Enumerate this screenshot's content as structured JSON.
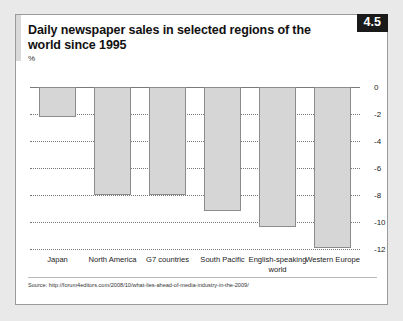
{
  "figure": {
    "number_badge": "4.5",
    "title": "Daily newspaper sales in selected regions of the world since 1995",
    "unit_label": "%",
    "source": "Source: http://forum4editors.com/2008/10/what-lies-ahead-of-media-industry-in-the-2009/"
  },
  "chart_data": {
    "type": "bar",
    "title": "Daily newspaper sales in selected regions of the world since 1995",
    "subtitle": "",
    "xlabel": "",
    "ylabel": "%",
    "ylim": [
      -12,
      0
    ],
    "yticks": [
      0,
      -2,
      -4,
      -6,
      -8,
      -10,
      -12
    ],
    "ytick_labels": [
      "0",
      "-2",
      "-4",
      "-6",
      "-8",
      "-10",
      "-12"
    ],
    "grid": true,
    "legend": false,
    "categories": [
      "Japan",
      "North America",
      "G7 countries",
      "South Pacific",
      "English-speaking world",
      "Western Europe"
    ],
    "values": [
      -2.2,
      -8.0,
      -8.0,
      -9.2,
      -10.4,
      -11.9
    ],
    "bar_fill_color": "#d6d6d6",
    "bar_border_color": "#8c8c8c"
  }
}
